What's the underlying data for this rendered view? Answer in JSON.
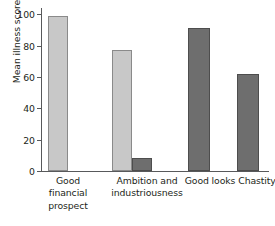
{
  "chart_data": {
    "type": "bar",
    "title": "",
    "xlabel": "",
    "ylabel": "Mean illness score",
    "ylim": [
      0,
      104
    ],
    "yticks": [
      0,
      20,
      40,
      60,
      80,
      100
    ],
    "ytick_labels": [
      "0",
      "20",
      "40",
      "60",
      "80",
      "100"
    ],
    "grid": false,
    "legend": "none",
    "categories": [
      "Good financial prospect",
      "Ambition and industriousness",
      "Good looks",
      "Chastity"
    ],
    "bars": [
      {
        "id": "bar-good-financial-prospect-light",
        "category": "Good financial prospect",
        "series": "light",
        "value": 99,
        "color": "#c8c8c8"
      },
      {
        "id": "bar-ambition-industriousness-light",
        "category": "Ambition and industriousness",
        "series": "light",
        "value": 77,
        "color": "#c8c8c8"
      },
      {
        "id": "bar-ambition-industriousness-dark",
        "category": "Ambition and industriousness",
        "series": "dark",
        "value": 8,
        "color": "#6e6e6e"
      },
      {
        "id": "bar-good-looks-dark",
        "category": "Good looks",
        "series": "dark",
        "value": 91,
        "color": "#6e6e6e"
      },
      {
        "id": "bar-chastity-dark",
        "category": "Chastity",
        "series": "dark",
        "value": 62,
        "color": "#6e6e6e"
      }
    ],
    "series": [
      {
        "name": "light",
        "color": "#c8c8c8",
        "values": [
          99,
          77,
          null,
          null
        ]
      },
      {
        "name": "dark",
        "color": "#6e6e6e",
        "values": [
          null,
          8,
          91,
          62
        ]
      }
    ]
  },
  "axis": {
    "y_label": "Mean illness score",
    "y_ticks": [
      "0",
      "20",
      "40",
      "60",
      "80",
      "100"
    ]
  },
  "x_labels": [
    {
      "line1": "Good",
      "line2": "financial",
      "line3": "prospect"
    },
    {
      "line1": "Ambition and",
      "line2": "industriousness",
      "line3": ""
    },
    {
      "line1": "Good looks",
      "line2": "",
      "line3": ""
    },
    {
      "line1": "Chastity",
      "line2": "",
      "line3": ""
    }
  ],
  "colors": {
    "light_bar": "#c8c8c8",
    "dark_bar": "#6e6e6e",
    "axis": "#58595b",
    "text": "#231f20",
    "background": "#ffffff"
  }
}
